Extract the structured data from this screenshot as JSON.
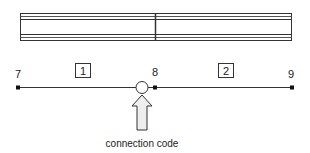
{
  "diagram": {
    "beam": {
      "segments": 2,
      "stroke_color": "#333333"
    },
    "nodes": [
      {
        "id": "7",
        "label": "7"
      },
      {
        "id": "8",
        "label": "8"
      },
      {
        "id": "9",
        "label": "9"
      }
    ],
    "elements": [
      {
        "id": "1",
        "label": "1"
      },
      {
        "id": "2",
        "label": "2"
      }
    ],
    "connection": {
      "symbol": "hinge-circle",
      "arrow_fill": "#eeeeee",
      "caption": "connection code"
    }
  }
}
